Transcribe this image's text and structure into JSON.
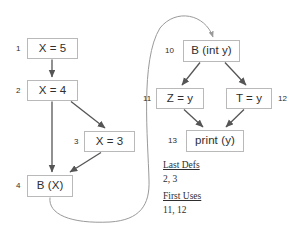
{
  "diagram": {
    "left_graph": {
      "nodes": [
        {
          "id": "n1",
          "number": "1",
          "label": "X = 5",
          "x": 27,
          "y": 38,
          "w": 51,
          "h": 21
        },
        {
          "id": "n2",
          "number": "2",
          "label": "X = 4",
          "x": 27,
          "y": 80,
          "w": 51,
          "h": 21
        },
        {
          "id": "n3",
          "number": "3",
          "label": "X = 3",
          "x": 84,
          "y": 131,
          "w": 51,
          "h": 21
        },
        {
          "id": "n4",
          "number": "4",
          "label": "B (X)",
          "x": 27,
          "y": 175,
          "w": 46,
          "h": 22
        }
      ],
      "number_positions": [
        {
          "for": "n1",
          "text": "1",
          "x": 16,
          "y": 45
        },
        {
          "for": "n2",
          "text": "2",
          "x": 16,
          "y": 87
        },
        {
          "for": "n3",
          "text": "3",
          "x": 74,
          "y": 138
        },
        {
          "for": "n4",
          "text": "4",
          "x": 16,
          "y": 182
        }
      ]
    },
    "right_graph": {
      "nodes": [
        {
          "id": "n10",
          "number": "10",
          "label": "B (int y)",
          "x": 183,
          "y": 40,
          "w": 57,
          "h": 22
        },
        {
          "id": "n11",
          "number": "11",
          "label": "Z = y",
          "x": 156,
          "y": 88,
          "w": 48,
          "h": 21
        },
        {
          "id": "n12",
          "number": "12",
          "label": "T = y",
          "x": 226,
          "y": 88,
          "w": 46,
          "h": 21
        },
        {
          "id": "n13",
          "number": "13",
          "label": "print (y)",
          "x": 186,
          "y": 130,
          "w": 58,
          "h": 22
        }
      ],
      "number_positions": [
        {
          "for": "n10",
          "text": "10",
          "x": 165,
          "y": 47
        },
        {
          "for": "n11",
          "text": "11",
          "x": 143,
          "y": 95
        },
        {
          "for": "n12",
          "text": "12",
          "x": 278,
          "y": 95
        },
        {
          "for": "n13",
          "text": "13",
          "x": 168,
          "y": 137
        }
      ]
    },
    "legend": {
      "last_defs_heading": "Last Defs",
      "last_defs_values": "2, 3",
      "first_uses_heading": "First Uses",
      "first_uses_values": "11,  12"
    },
    "colors": {
      "box_border": "#b9b9b9",
      "text": "#2e2e2e",
      "edge": "#555555",
      "call_edge": "#9a9a9a",
      "background": "#ffffff"
    }
  }
}
